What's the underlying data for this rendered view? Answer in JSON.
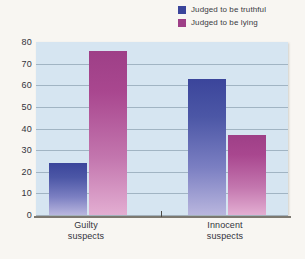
{
  "chart_data": {
    "type": "bar",
    "title": "",
    "xlabel": "",
    "ylabel": "",
    "ylim": [
      0,
      80
    ],
    "yticks": [
      80,
      70,
      60,
      50,
      40,
      30,
      20,
      10,
      0
    ],
    "grid": true,
    "legend_position": "top-right",
    "categories": [
      "Guilty suspects",
      "Innocent suspects"
    ],
    "category_lines": [
      [
        "Guilty",
        "suspects"
      ],
      [
        "Innocent",
        "suspects"
      ]
    ],
    "series": [
      {
        "name": "Judged to be truthful",
        "color": "#3b459b",
        "values": [
          24,
          63
        ]
      },
      {
        "name": "Judged to be lying",
        "color": "#9e3f87",
        "values": [
          76,
          37
        ]
      }
    ]
  },
  "legend": {
    "items": [
      {
        "label": "Judged to be truthful",
        "swatch_name": "legend-swatch-truthful"
      },
      {
        "label": "Judged to be lying",
        "swatch_name": "legend-swatch-lying"
      }
    ]
  },
  "caption": {
    "text": ""
  },
  "colors": {
    "plot_background": "#d6e5f1",
    "page_background": "#f8f6f2",
    "gridline": "#8fa3b3",
    "axis": "#7c7870",
    "blue_top": "#3b459b",
    "blue_bottom": "#b9b6de",
    "magenta_top": "#9e3f87",
    "magenta_bottom": "#e3aed2"
  }
}
